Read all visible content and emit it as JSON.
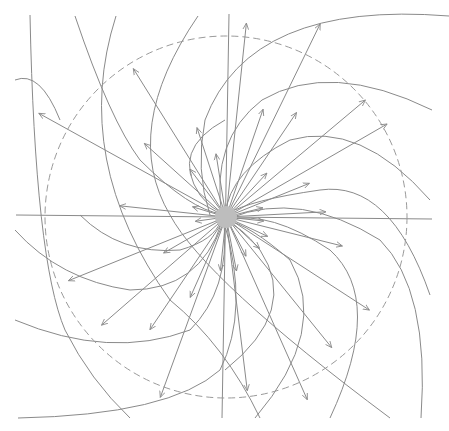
{
  "diagram": {
    "type": "radial field-line diagram",
    "colors": {
      "stroke": "#8a8a8a",
      "center": "#bdbdbd",
      "dashed": "#9a9a9a",
      "background": "#ffffff"
    },
    "center": {
      "x": 226,
      "y": 217,
      "r": 11
    },
    "reference_circle": {
      "r": 181,
      "style": "dashed"
    },
    "axes": {
      "horizontal": {
        "x1": 16,
        "y1": 215,
        "x2": 432,
        "y2": 219
      },
      "vertical": {
        "x1": 229,
        "y1": 14,
        "x2": 222,
        "y2": 418
      }
    },
    "radial_arrows": [
      {
        "angle": -84,
        "length": 195
      },
      {
        "angle": -71,
        "length": 114
      },
      {
        "angle": -64,
        "length": 215
      },
      {
        "angle": -56,
        "length": 126
      },
      {
        "angle": -47,
        "length": 60
      },
      {
        "angle": -40,
        "length": 182
      },
      {
        "angle": -30,
        "length": 186
      },
      {
        "angle": -22,
        "length": 90
      },
      {
        "angle": -14,
        "length": 38
      },
      {
        "angle": -3,
        "length": 100
      },
      {
        "angle": 6,
        "length": 38
      },
      {
        "angle": 14,
        "length": 120
      },
      {
        "angle": 25,
        "length": 46
      },
      {
        "angle": 33,
        "length": 171
      },
      {
        "angle": 43,
        "length": 46
      },
      {
        "angle": 51,
        "length": 168
      },
      {
        "angle": 63,
        "length": 44
      },
      {
        "angle": 66,
        "length": 200
      },
      {
        "angle": 79,
        "length": 55
      },
      {
        "angle": 83,
        "length": 175
      },
      {
        "angle": 96,
        "length": 54
      },
      {
        "angle": 110,
        "length": 192
      },
      {
        "angle": 114,
        "length": 88
      },
      {
        "angle": 124,
        "length": 136
      },
      {
        "angle": 139,
        "length": 165
      },
      {
        "angle": 150,
        "length": 72
      },
      {
        "angle": 158,
        "length": 170
      },
      {
        "angle": 172,
        "length": 31
      },
      {
        "angle": 186,
        "length": 107
      },
      {
        "angle": 197,
        "length": 35
      },
      {
        "angle": 209,
        "length": 214
      },
      {
        "angle": 222,
        "length": 110
      },
      {
        "angle": 233,
        "length": 60
      },
      {
        "angle": 238,
        "length": 175
      },
      {
        "angle": 252,
        "length": 94
      },
      {
        "angle": 261,
        "length": 64
      }
    ],
    "field_arcs": [
      "M 30 15 Q 35 260 65 330 Q 90 380 130 418",
      "M 116 16 Q 70 160 170 300 Q 225 345 260 418",
      "M 198 16 Q 120 130 170 215 Q 205 280 390 418",
      "M 449 16 Q 250 0 205 120 Q 195 170 210 215",
      "M 432 110 Q 330 60 262 100 Q 210 140 222 217",
      "M 430 200 Q 360 120 290 140 Q 230 170 225 215",
      "M 430 295 Q 390 180 320 190 Q 250 200 227 214",
      "M 421 418 Q 430 290 380 240 Q 300 190 230 218",
      "M 330 418 Q 385 300 330 250 Q 270 210 228 220",
      "M 255 418 Q 330 330 290 260 Q 250 225 226 220",
      "M 225 370 Q 300 310 260 250 Q 240 225 226 222",
      "M 18 418 Q 170 415 220 370 Q 250 310 224 222",
      "M 15 320 Q 110 360 190 330 Q 230 290 224 222",
      "M 15 230 Q 60 280 130 290 Q 200 290 222 222",
      "M 80 215 Q 120 255 180 250 Q 215 240 221 220",
      "M 75 16 Q 110 120 140 160 Q 190 210 222 214",
      "M 225 120 Q 170 150 200 195 Q 212 210 224 213",
      "M 15 80 Q 40 70 60 120"
    ]
  }
}
